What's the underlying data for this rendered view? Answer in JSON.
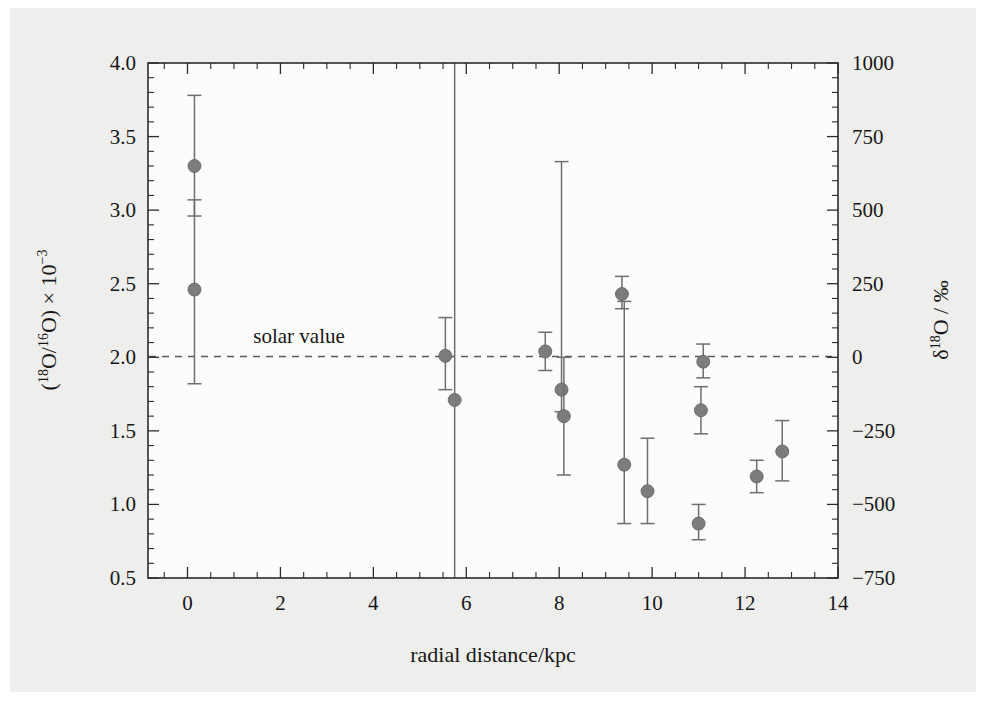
{
  "figure": {
    "background_color": "#eeeeec",
    "plot_background_color": "#fcfcfc",
    "marker_color": "#7c7c7c",
    "axis_color": "#2b2b2b"
  },
  "chart_data": {
    "type": "scatter",
    "title": "",
    "xlabel": "radial distance/kpc",
    "ylabel": "(18O/16O) × 10−3",
    "ylabel_parts": {
      "open_paren": "(",
      "sup1": "18",
      "base1": "O/",
      "sup2": "16",
      "base2": "O",
      "close_paren": ")",
      "times": " × 10",
      "exponent": "−3"
    },
    "y2label": "δ18O / ‰",
    "y2label_parts": {
      "delta": "δ",
      "sup": "18",
      "base": "O / ‰"
    },
    "xlim": [
      -0.85,
      14.0
    ],
    "ylim": [
      0.5,
      4.0
    ],
    "y2lim": [
      -750,
      1000
    ],
    "xticks": [
      0,
      2,
      4,
      6,
      8,
      10,
      12,
      14
    ],
    "xticklabels": [
      "0",
      "2",
      "4",
      "6",
      "8",
      "10",
      "12",
      "14"
    ],
    "x_minor_step": 0.5,
    "yticks": [
      0.5,
      1.0,
      1.5,
      2.0,
      2.5,
      3.0,
      3.5,
      4.0
    ],
    "yticklabels": [
      "0.5",
      "1.0",
      "1.5",
      "2.0",
      "2.5",
      "3.0",
      "3.5",
      "4.0"
    ],
    "y_minor_step": 0.1,
    "y2ticks": [
      -750,
      -500,
      -250,
      0,
      250,
      500,
      750,
      1000
    ],
    "y2ticklabels": [
      "−750",
      "−500",
      "−250",
      "0",
      "250",
      "500",
      "750",
      "1000"
    ],
    "y2_minor_step": 50,
    "grid": false,
    "legend": null,
    "annotations": [
      {
        "text": "solar value",
        "x": 2.4,
        "y": 2.1,
        "kind": "reference-line-label"
      }
    ],
    "reference_lines": [
      {
        "name": "solar-value-line",
        "orientation": "horizontal",
        "y": 2.005,
        "style": "dashed",
        "label": "solar value"
      }
    ],
    "points": [
      {
        "x": 0.15,
        "y": 3.3,
        "yerr_low": 2.96,
        "yerr_high": 3.78
      },
      {
        "x": 0.15,
        "y": 2.46,
        "yerr_low": 1.82,
        "yerr_high": 3.07
      },
      {
        "x": 5.55,
        "y": 2.01,
        "yerr_low": 1.78,
        "yerr_high": 2.27
      },
      {
        "x": 5.75,
        "y": 1.71,
        "yerr_low": 0.5,
        "yerr_high": 4.0
      },
      {
        "x": 7.7,
        "y": 2.04,
        "yerr_low": 1.91,
        "yerr_high": 2.17
      },
      {
        "x": 8.05,
        "y": 1.78,
        "yerr_low": 1.63,
        "yerr_high": 3.33
      },
      {
        "x": 8.1,
        "y": 1.6,
        "yerr_low": 1.2,
        "yerr_high": 2.0
      },
      {
        "x": 9.35,
        "y": 2.43,
        "yerr_low": 2.33,
        "yerr_high": 2.55
      },
      {
        "x": 9.4,
        "y": 1.27,
        "yerr_low": 0.87,
        "yerr_high": 2.38
      },
      {
        "x": 9.9,
        "y": 1.09,
        "yerr_low": 0.87,
        "yerr_high": 1.45
      },
      {
        "x": 11.0,
        "y": 0.87,
        "yerr_low": 0.76,
        "yerr_high": 1.0
      },
      {
        "x": 11.05,
        "y": 1.64,
        "yerr_low": 1.48,
        "yerr_high": 1.8
      },
      {
        "x": 11.1,
        "y": 1.97,
        "yerr_low": 1.86,
        "yerr_high": 2.09
      },
      {
        "x": 12.25,
        "y": 1.19,
        "yerr_low": 1.08,
        "yerr_high": 1.3
      },
      {
        "x": 12.8,
        "y": 1.36,
        "yerr_low": 1.16,
        "yerr_high": 1.57
      }
    ]
  }
}
